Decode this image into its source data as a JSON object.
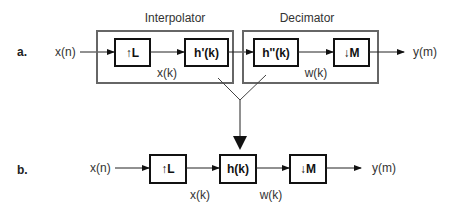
{
  "diagram": {
    "part_a": {
      "label": "a.",
      "input": "x(n)",
      "output": "y(m)",
      "groups": [
        {
          "title": "Interpolator",
          "blocks": [
            "↑L",
            "h'(k)"
          ],
          "signal": "x(k)"
        },
        {
          "title": "Decimator",
          "blocks": [
            "h''(k)",
            "↓M"
          ],
          "signal": "w(k)"
        }
      ]
    },
    "part_b": {
      "label": "b.",
      "input": "x(n)",
      "output": "y(m)",
      "blocks": [
        "↑L",
        "h(k)",
        "↓M"
      ],
      "signals": [
        "x(k)",
        "w(k)"
      ]
    },
    "colors": {
      "block_border": "#111111",
      "group_border": "#666666",
      "background": "#ffffff"
    }
  }
}
